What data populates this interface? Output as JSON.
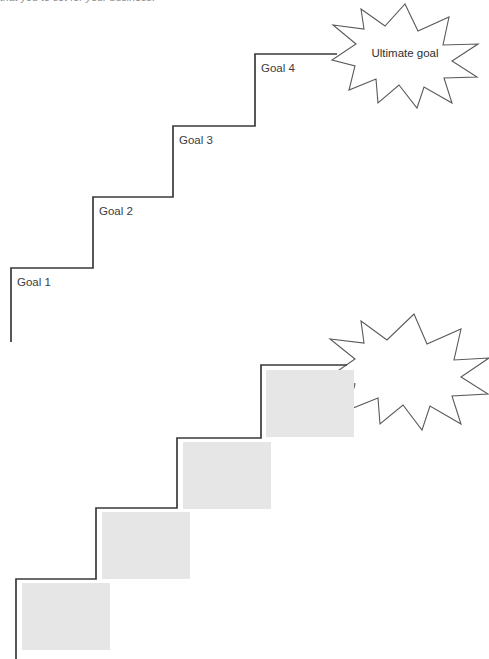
{
  "page": {
    "caption_clipped": "that you to set for your business.",
    "background_color": "#ffffff"
  },
  "colors": {
    "stair_stroke": "#3a3a3a",
    "burst_stroke": "#5a5a5a",
    "placeholder_fill": "#e6e6e6",
    "label_text": "#3b3b3b",
    "caption_text": "#8b8b8b"
  },
  "diagram_top": {
    "name": "goal-staircase-labeled",
    "steps": [
      {
        "label": "Goal 1"
      },
      {
        "label": "Goal 2"
      },
      {
        "label": "Goal 3"
      },
      {
        "label": "Goal 4"
      }
    ],
    "burst": {
      "label": "Ultimate goal"
    }
  },
  "diagram_bottom": {
    "name": "goal-staircase-blank",
    "steps": [
      {
        "label": ""
      },
      {
        "label": ""
      },
      {
        "label": ""
      },
      {
        "label": ""
      }
    ],
    "burst": {
      "label": ""
    }
  }
}
